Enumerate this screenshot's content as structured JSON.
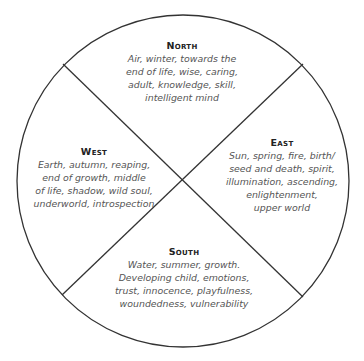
{
  "diagram": {
    "type": "medicine-wheel",
    "circle": {
      "cx": 183,
      "cy": 181,
      "r": 166,
      "stroke": "#333333"
    },
    "dividers": [
      {
        "x1": 63,
        "y1": 64,
        "x2": 303,
        "y2": 297
      },
      {
        "x1": 303,
        "y1": 64,
        "x2": 62,
        "y2": 295
      }
    ],
    "quadrants": {
      "north": {
        "title": "North",
        "lines": [
          "Air, winter, towards the",
          "end of life, wise, caring,",
          "adult, knowledge, skill,",
          "intelligent mind"
        ]
      },
      "west": {
        "title": "West",
        "lines": [
          "Earth, autumn, reaping,",
          "end of growth, middle",
          "of life, shadow, wild soul,",
          "underworld, introspection"
        ]
      },
      "east": {
        "title": "East",
        "lines": [
          "Sun, spring, fire, birth/",
          "seed and death, spirit,",
          "illumination, ascending,",
          "enlightenment,",
          "upper world"
        ]
      },
      "south": {
        "title": "South",
        "lines": [
          "Water, summer, growth.",
          "Developing child, emotions,",
          "trust, innocence, playfulness,",
          "woundedness, vulnerability"
        ]
      }
    },
    "colors": {
      "title": "#222222",
      "body": "#555555",
      "line": "#333333"
    }
  }
}
